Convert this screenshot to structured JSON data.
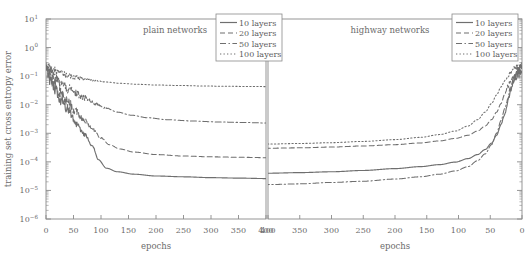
{
  "figure": {
    "ylabel": "training set cross entropy error",
    "xlabel_left": "epochs",
    "xlabel_right": "epochs",
    "panel_left_title": "plain networks",
    "panel_right_title": "highway networks"
  },
  "legend": {
    "items": [
      {
        "label": "10 layers",
        "style": "solid"
      },
      {
        "label": "20 layers",
        "style": "dashed"
      },
      {
        "label": "50 layers",
        "style": "dashdot"
      },
      {
        "label": "100 layers",
        "style": "dotted"
      }
    ]
  },
  "axes": {
    "y_ticks": [
      "10 1",
      "10 0",
      "10 -1",
      "10 -2",
      "10 -3",
      "10 -4",
      "10 -5",
      "10 -6"
    ],
    "y_exponents": [
      1,
      0,
      -1,
      -2,
      -3,
      -4,
      -5,
      -6
    ],
    "y_base": "10",
    "x_ticks_left": [
      0,
      50,
      100,
      150,
      200,
      250,
      300,
      350,
      400
    ],
    "x_ticks_right": [
      400,
      350,
      300,
      250,
      200,
      150,
      100,
      50,
      0
    ]
  },
  "colors": {
    "frame": "#8a8a8a",
    "curve": "#6f6f6f",
    "text": "#6b6b6b",
    "background": "#ffffff"
  },
  "chart_data": {
    "type": "line",
    "title": "",
    "xlabel": "epochs",
    "ylabel": "training set cross entropy error",
    "yscale": "log",
    "ylim": [
      1e-06,
      10
    ],
    "grid": false,
    "legend_position": "top-right",
    "panels": [
      {
        "name": "plain networks",
        "xlim": [
          0,
          400
        ],
        "x_reversed": false,
        "series": [
          {
            "name": "10 layers",
            "style": "solid",
            "noise": 0.3,
            "noise_end_x": 95,
            "x": [
              0,
              5,
              12,
              25,
              40,
              55,
              70,
              85,
              95,
              110,
              130,
              160,
              200,
              250,
              300,
              350,
              400
            ],
            "values": [
              0.18,
              0.09,
              0.045,
              0.016,
              0.006,
              0.0022,
              0.0009,
              0.00035,
              0.00012,
              6e-05,
              4.5e-05,
              3.7e-05,
              3.2e-05,
              3e-05,
              2.8e-05,
              2.7e-05,
              2.6e-05
            ]
          },
          {
            "name": "20 layers",
            "style": "dashed",
            "noise": 0.32,
            "noise_end_x": 110,
            "x": [
              0,
              5,
              12,
              25,
              40,
              55,
              70,
              85,
              100,
              115,
              135,
              160,
              200,
              250,
              300,
              350,
              400
            ],
            "values": [
              0.2,
              0.11,
              0.06,
              0.026,
              0.012,
              0.0055,
              0.0028,
              0.0014,
              0.0007,
              0.0004,
              0.00028,
              0.00022,
              0.00018,
              0.00016,
              0.00015,
              0.000145,
              0.00014
            ]
          },
          {
            "name": "50 layers",
            "style": "dashdot",
            "noise": 0.28,
            "noise_end_x": 120,
            "x": [
              0,
              5,
              12,
              25,
              40,
              55,
              70,
              90,
              110,
              130,
              155,
              185,
              220,
              265,
              310,
              355,
              400
            ],
            "values": [
              0.24,
              0.16,
              0.105,
              0.06,
              0.036,
              0.024,
              0.017,
              0.011,
              0.0075,
              0.0055,
              0.0043,
              0.0035,
              0.003,
              0.0027,
              0.0025,
              0.0024,
              0.0023
            ]
          },
          {
            "name": "100 layers",
            "style": "dotted",
            "noise": 0.16,
            "noise_end_x": 110,
            "x": [
              0,
              5,
              12,
              25,
              40,
              55,
              70,
              90,
              110,
              135,
              165,
              200,
              245,
              290,
              335,
              370,
              400
            ],
            "values": [
              0.27,
              0.215,
              0.17,
              0.13,
              0.105,
              0.09,
              0.08,
              0.069,
              0.062,
              0.056,
              0.052,
              0.049,
              0.047,
              0.045,
              0.044,
              0.0435,
              0.043
            ]
          }
        ]
      },
      {
        "name": "highway networks",
        "xlim": [
          0,
          400
        ],
        "x_reversed": true,
        "series": [
          {
            "name": "10 layers",
            "style": "solid",
            "noise": 0.3,
            "noise_end_x": 35,
            "x": [
              400,
              350,
              300,
              250,
              200,
              160,
              130,
              105,
              85,
              70,
              58,
              48,
              40,
              33,
              27,
              22,
              18,
              14,
              10,
              6,
              3,
              0
            ],
            "values": [
              4e-05,
              4.2e-05,
              4.5e-05,
              5e-05,
              5.8e-05,
              6.8e-05,
              8e-05,
              9.8e-05,
              0.00013,
              0.00018,
              0.00027,
              0.00045,
              0.00085,
              0.002,
              0.005,
              0.013,
              0.032,
              0.06,
              0.095,
              0.135,
              0.165,
              0.19
            ]
          },
          {
            "name": "20 layers",
            "style": "dashed",
            "noise": 0.3,
            "noise_end_x": 30,
            "x": [
              400,
              350,
              300,
              250,
              200,
              160,
              130,
              105,
              85,
              70,
              58,
              48,
              40,
              33,
              27,
              22,
              18,
              14,
              10,
              6,
              3,
              0
            ],
            "values": [
              0.0003,
              0.00031,
              0.00033,
              0.00036,
              0.0004,
              0.00046,
              0.00054,
              0.00066,
              0.00085,
              0.0012,
              0.0018,
              0.003,
              0.0055,
              0.011,
              0.024,
              0.045,
              0.07,
              0.095,
              0.125,
              0.155,
              0.18,
              0.2
            ]
          },
          {
            "name": "50 layers",
            "style": "dashdot",
            "noise": 0.26,
            "noise_end_x": 30,
            "x": [
              400,
              350,
              300,
              250,
              200,
              160,
              130,
              105,
              85,
              70,
              58,
              48,
              40,
              33,
              27,
              22,
              18,
              14,
              10,
              6,
              3,
              0
            ],
            "values": [
              1.6e-05,
              1.7e-05,
              1.9e-05,
              2.1e-05,
              2.5e-05,
              3e-05,
              3.7e-05,
              4.8e-05,
              6.8e-05,
              0.00011,
              0.00019,
              0.0004,
              0.001,
              0.0028,
              0.0075,
              0.018,
              0.038,
              0.065,
              0.1,
              0.14,
              0.17,
              0.195
            ]
          },
          {
            "name": "100 layers",
            "style": "dotted",
            "noise": 0.2,
            "noise_end_x": 30,
            "x": [
              400,
              350,
              300,
              250,
              200,
              160,
              130,
              105,
              85,
              70,
              58,
              48,
              40,
              33,
              27,
              22,
              18,
              14,
              10,
              6,
              3,
              0
            ],
            "values": [
              0.00042,
              0.00044,
              0.00047,
              0.00052,
              0.0006,
              0.00072,
              0.0009,
              0.0012,
              0.0018,
              0.003,
              0.0055,
              0.011,
              0.022,
              0.042,
              0.07,
              0.1,
              0.135,
              0.165,
              0.195,
              0.225,
              0.245,
              0.26
            ]
          }
        ]
      }
    ]
  }
}
